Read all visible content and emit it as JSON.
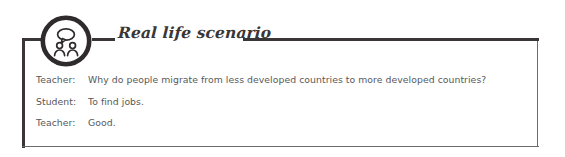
{
  "card": {
    "title": "Real life scenario",
    "badge_icon": "two-people-speech-bubble-icon",
    "frame_color": "#3a3638",
    "thin_border_color": "#6d6a6c",
    "text_color": "#58585a",
    "title_color": "#3a3638",
    "background": "#ffffff"
  },
  "dialogue": [
    {
      "speaker": "Teacher:",
      "text": "Why do people migrate from less developed countries to more developed countries?"
    },
    {
      "speaker": "Student:",
      "text": "To find jobs."
    },
    {
      "speaker": "Teacher:",
      "text": "Good."
    }
  ]
}
